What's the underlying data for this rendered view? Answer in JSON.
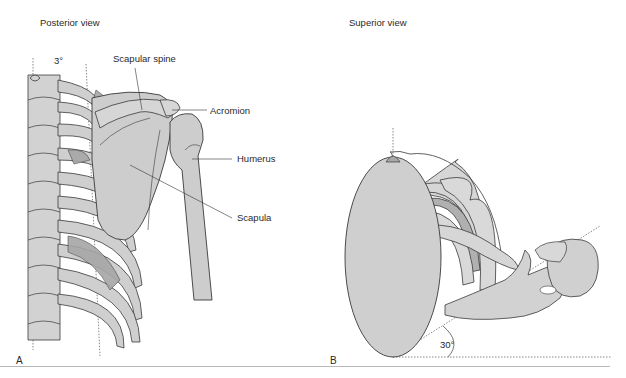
{
  "figure": {
    "panels": [
      {
        "letter": "A",
        "title": "Posterior view",
        "angle_label": "3°",
        "labels": {
          "scapular_spine": "Scapular spine",
          "acromion": "Acromion",
          "humerus": "Humerus",
          "scapula": "Scapula"
        }
      },
      {
        "letter": "B",
        "title": "Superior view",
        "angle_label": "30°"
      }
    ],
    "colors": {
      "bone_fill": "#d0d0d0",
      "bone_dark": "#a8a8a8",
      "outline": "#3a3a3a",
      "background": "#ffffff"
    }
  }
}
